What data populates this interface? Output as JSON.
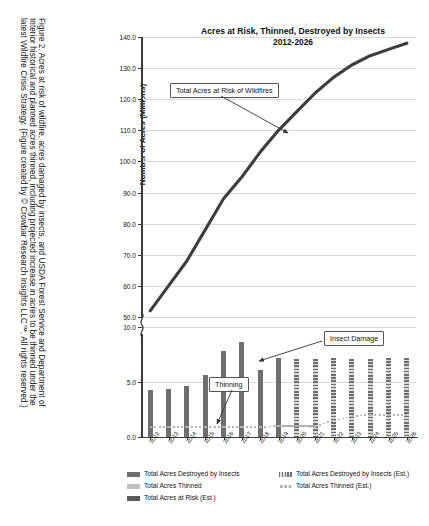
{
  "figure": {
    "caption_lines": [
      "Figure 2. Acres at risk of wildfire, acres damaged by insects, and USDA Forest Service and Department of",
      "Interior historical and planned acres thinned, including projected increase in acres to be thinned under the",
      "latest Wildfire Crisis Strategy. (Figure created by © Crowbar Research Insights LLC™. All rights reserved.)"
    ]
  },
  "chart_data": {
    "type": "bar",
    "title": "Acres at Risk, Thinned, Destroyed by Insects",
    "subtitle": "2012-2026",
    "xlabel": "",
    "ylabel": "Number of Acres (Millions)",
    "grid": true,
    "legend_position": "bottom",
    "axis_break": true,
    "ylim_lower": [
      0,
      10
    ],
    "ylim_upper": [
      50,
      140
    ],
    "ytick_labels_lower": [
      "0.0",
      "5.0",
      "10.0"
    ],
    "ytick_labels_upper": [
      "50.0",
      "60.0",
      "70.0",
      "80.0",
      "90.0",
      "100.0",
      "110.0",
      "120.0",
      "130.0",
      "140.0"
    ],
    "categories": [
      "2012",
      "2013",
      "2014",
      "2015",
      "2016",
      "2017",
      "2018",
      "2019",
      "2020",
      "2021",
      "2022",
      "2023",
      "2024",
      "2025",
      "2026"
    ],
    "series": [
      {
        "name": "Total Acres Destroyed by Insects",
        "kind": "bar",
        "style": "solid",
        "color": "#6e6e6e",
        "values": [
          4.3,
          4.4,
          4.6,
          5.6,
          7.8,
          8.6,
          6.1,
          7.2,
          null,
          null,
          null,
          null,
          null,
          null,
          null
        ]
      },
      {
        "name": "Total Acres Destroyed by Insects (Est.)",
        "kind": "bar",
        "style": "hatched",
        "color": "#6e6e6e",
        "values": [
          null,
          null,
          null,
          null,
          null,
          null,
          null,
          null,
          7.1,
          7.1,
          7.2,
          7.1,
          7.1,
          7.2,
          7.2
        ]
      },
      {
        "name": "Total Acres Thinned",
        "kind": "line",
        "style": "dotted",
        "color": "#b4b4b4",
        "values": [
          0.9,
          0.9,
          0.9,
          0.9,
          0.9,
          0.9,
          0.9,
          1.0,
          1.0,
          0.9,
          null,
          null,
          null,
          null,
          null
        ]
      },
      {
        "name": "Total Acres Thinned (Est.)",
        "kind": "line",
        "style": "dotted",
        "color": "#b4b4b4",
        "values": [
          null,
          null,
          null,
          null,
          null,
          null,
          null,
          null,
          null,
          1.0,
          1.5,
          1.9,
          2.0,
          2.0,
          2.0
        ]
      },
      {
        "name": "Total Acres at Risk (Est.)",
        "kind": "line",
        "style": "thick-solid",
        "color": "#3d3d3d",
        "values": [
          52,
          60,
          68,
          78,
          88,
          95,
          103,
          110,
          116,
          122,
          127,
          131,
          134,
          136,
          138
        ]
      }
    ],
    "annotations": [
      {
        "text": "Total Acres at Risk of Wildfires",
        "target": "risk-line"
      },
      {
        "text": "Insect Damage",
        "target": "insect-bars"
      },
      {
        "text": "Thinning",
        "target": "thinning-line"
      }
    ],
    "legend": [
      {
        "label": "Total Acres Destroyed by Insects",
        "swatch": "solid-dark"
      },
      {
        "label": "Total Acres Destroyed by Insects (Est.)",
        "swatch": "hatched"
      },
      {
        "label": "Total Acres Thinned",
        "swatch": "solid-light"
      },
      {
        "label": "Total Acres Thinned (Est.)",
        "swatch": "dotted"
      },
      {
        "label": "Total Acres at Risk (Est.)",
        "swatch": "solid-darker"
      }
    ]
  }
}
